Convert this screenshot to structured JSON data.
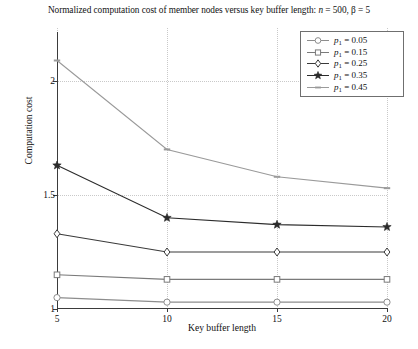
{
  "chart_data": {
    "type": "line",
    "title": "Normalized computation cost of member nodes versus key buffer length: n = 500, β = 5",
    "title_parts": {
      "lead": "Normalized computation cost of member nodes versus key buffer length: ",
      "n_sym": "n",
      "n_val": " = 500, ",
      "beta_sym": "β",
      "beta_val": " = 5"
    },
    "xlabel": "Key buffer length",
    "ylabel": "Computation cost",
    "x": [
      5,
      10,
      15,
      20
    ],
    "xticklabels": [
      "5",
      "10",
      "15",
      "20"
    ],
    "yticks": [
      1,
      1.5,
      2
    ],
    "yticklabels": [
      "1",
      "1.5",
      "2"
    ],
    "xlim": [
      5,
      20
    ],
    "ylim": [
      1,
      2.215
    ],
    "grid": "dotted",
    "legend_position": "upper right",
    "series": [
      {
        "name": "p₁ = 0.05",
        "param": "p",
        "subscript": "1",
        "value": " = 0.05",
        "marker": "circle",
        "color": "#8d8d8d",
        "values": [
          1.05,
          1.03,
          1.03,
          1.03
        ]
      },
      {
        "name": "p₁ = 0.15",
        "param": "p",
        "subscript": "1",
        "value": " = 0.15",
        "marker": "square",
        "color": "#7a7a7a",
        "values": [
          1.15,
          1.13,
          1.13,
          1.13
        ]
      },
      {
        "name": "p₁ = 0.25",
        "param": "p",
        "subscript": "1",
        "value": " = 0.25",
        "marker": "diamond",
        "color": "#3a3a3a",
        "values": [
          1.33,
          1.25,
          1.25,
          1.25
        ]
      },
      {
        "name": "p₁ = 0.35",
        "param": "p",
        "subscript": "1",
        "value": " = 0.35",
        "marker": "star",
        "color": "#2b2b2b",
        "values": [
          1.63,
          1.4,
          1.37,
          1.36
        ]
      },
      {
        "name": "p₁ = 0.45",
        "param": "p",
        "subscript": "1",
        "value": " = 0.45",
        "marker": "dash",
        "color": "#9a9a9a",
        "values": [
          2.09,
          1.7,
          1.58,
          1.53
        ]
      }
    ]
  }
}
